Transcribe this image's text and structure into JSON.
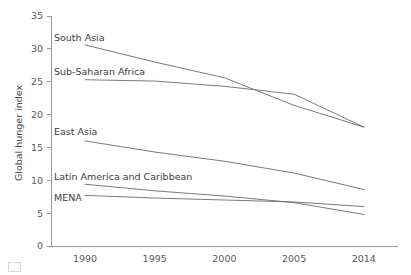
{
  "chart_data": {
    "type": "line",
    "title": "",
    "xlabel": "",
    "ylabel": "Global hunger index",
    "categories": [
      "1990",
      "1995",
      "2000",
      "2005",
      "2014"
    ],
    "x": [
      1990,
      1995,
      2000,
      2005,
      2014
    ],
    "ylim": [
      0,
      35
    ],
    "yticks": [
      0,
      5,
      10,
      15,
      20,
      25,
      30,
      35
    ],
    "ytick_labels": [
      "0",
      "5",
      "10",
      "15",
      "20",
      "25",
      "30",
      "35"
    ],
    "xtick_labels": [
      "1990",
      "1995",
      "2000",
      "2005",
      "2014"
    ],
    "grid": false,
    "legend": "inline-labels-left",
    "series": [
      {
        "name": "South Asia",
        "label": "South Asia",
        "values": [
          30.6,
          28.0,
          25.6,
          21.4,
          18.1
        ],
        "color": "#6b6b6b"
      },
      {
        "name": "Sub-Saharan Africa",
        "label": "Sub-Saharan Africa",
        "values": [
          25.3,
          25.1,
          24.3,
          23.1,
          18.1
        ],
        "color": "#6b6b6b"
      },
      {
        "name": "East Asia",
        "label": "East Asia",
        "values": [
          16.0,
          14.3,
          12.9,
          11.1,
          8.6
        ],
        "color": "#6b6b6b"
      },
      {
        "name": "Latin America and Caribbean",
        "label": "Latin America and Caribbean",
        "values": [
          9.4,
          8.4,
          7.6,
          6.6,
          4.8
        ],
        "color": "#6b6b6b"
      },
      {
        "name": "MENA",
        "label": "MENA",
        "values": [
          7.7,
          7.3,
          7.0,
          6.7,
          6.0
        ],
        "color": "#6b6b6b"
      }
    ],
    "annotations": [
      {
        "text": "South Asia",
        "x_px": 54,
        "y_px": 41
      },
      {
        "text": "Sub-Saharan Africa",
        "x_px": 54,
        "y_px": 75
      },
      {
        "text": "East Asia",
        "x_px": 54,
        "y_px": 135
      },
      {
        "text": "Latin America and Caribbean",
        "x_px": 54,
        "y_px": 180
      },
      {
        "text": "MENA",
        "x_px": 54,
        "y_px": 201
      }
    ]
  },
  "axes": {
    "y_title": "Global hunger index"
  },
  "colors": {
    "line": "#6b6b6b",
    "axis": "#9a9a9a",
    "text": "#4a4a4a",
    "background": "#ffffff"
  }
}
